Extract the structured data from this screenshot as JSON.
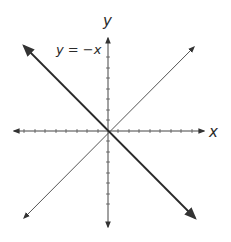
{
  "diagram": {
    "x_axis_label": "x",
    "y_axis_label": "y",
    "line_label": "y = −x",
    "colors": {
      "axis": "#333333",
      "line": "#2a2a2a",
      "thin_line": "#555555"
    },
    "lines": [
      {
        "name": "y = -x",
        "style": "thick"
      },
      {
        "name": "y = x",
        "style": "thin"
      }
    ],
    "ticks_per_half_axis": 9
  }
}
